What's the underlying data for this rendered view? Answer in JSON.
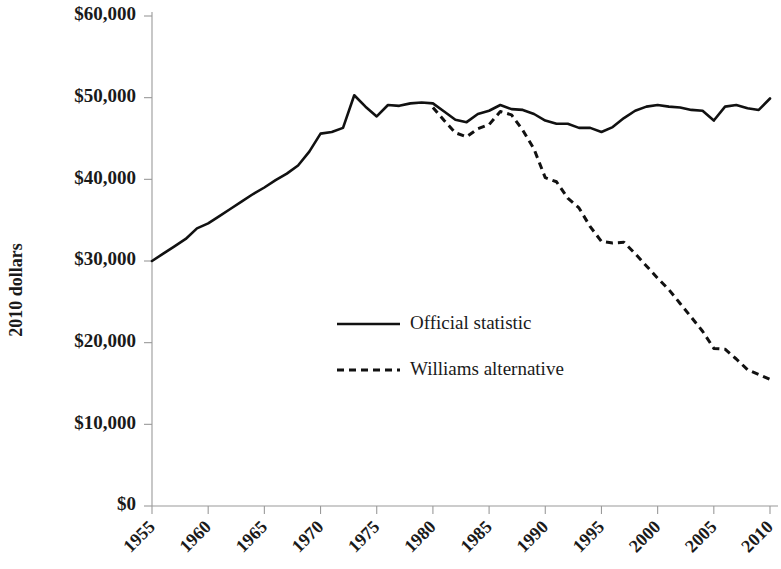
{
  "chart_data": {
    "type": "line",
    "title": "",
    "subtitle": "",
    "xlabel": "",
    "ylabel": "2010 dollars",
    "xlim": [
      1955,
      2010
    ],
    "ylim": [
      0,
      60000
    ],
    "grid": false,
    "legend_position": "center",
    "x_tick_labels": [
      "1955",
      "1960",
      "1965",
      "1970",
      "1975",
      "1980",
      "1985",
      "1990",
      "1995",
      "2000",
      "2005",
      "2010"
    ],
    "x_ticks": [
      1955,
      1960,
      1965,
      1970,
      1975,
      1980,
      1985,
      1990,
      1995,
      2000,
      2005,
      2010
    ],
    "y_tick_labels": [
      "$0",
      "$10,000",
      "$20,000",
      "$30,000",
      "$40,000",
      "$50,000",
      "$60,000"
    ],
    "y_ticks": [
      0,
      10000,
      20000,
      30000,
      40000,
      50000,
      60000
    ],
    "series": [
      {
        "name": "Official statistic",
        "style": "solid",
        "color": "#111111",
        "x": [
          1955,
          1956,
          1957,
          1958,
          1959,
          1960,
          1961,
          1962,
          1963,
          1964,
          1965,
          1966,
          1967,
          1968,
          1969,
          1970,
          1971,
          1972,
          1973,
          1974,
          1975,
          1976,
          1977,
          1978,
          1979,
          1980,
          1981,
          1982,
          1983,
          1984,
          1985,
          1986,
          1987,
          1988,
          1989,
          1990,
          1991,
          1992,
          1993,
          1994,
          1995,
          1996,
          1997,
          1998,
          1999,
          2000,
          2001,
          2002,
          2003,
          2004,
          2005,
          2006,
          2007,
          2008,
          2009,
          2010
        ],
        "y": [
          30000,
          30900,
          31800,
          32700,
          34000,
          34600,
          35500,
          36400,
          37300,
          38200,
          39000,
          39900,
          40700,
          41700,
          43400,
          45600,
          45800,
          46300,
          50300,
          48900,
          47700,
          49100,
          49000,
          49300,
          49400,
          49300,
          48300,
          47300,
          47000,
          48000,
          48400,
          49100,
          48600,
          48500,
          48000,
          47200,
          46800,
          46800,
          46300,
          46300,
          45800,
          46400,
          47500,
          48400,
          48900,
          49100,
          48900,
          48800,
          48500,
          48400,
          47200,
          48900,
          49100,
          48700,
          48500,
          49900
        ]
      },
      {
        "name": "Williams alternative",
        "style": "dashed",
        "color": "#111111",
        "x": [
          1980,
          1981,
          1982,
          1983,
          1984,
          1985,
          1986,
          1987,
          1988,
          1989,
          1990,
          1991,
          1992,
          1993,
          1994,
          1995,
          1996,
          1997,
          1998,
          1999,
          2000,
          2001,
          2002,
          2003,
          2004,
          2005,
          2006,
          2007,
          2008,
          2009,
          2010
        ],
        "y": [
          48800,
          47200,
          45700,
          45200,
          46200,
          46700,
          48300,
          47900,
          46000,
          43700,
          40200,
          39700,
          37700,
          36500,
          34200,
          32400,
          32200,
          32300,
          30900,
          29400,
          27900,
          26500,
          24800,
          23100,
          21400,
          19300,
          19200,
          18000,
          16700,
          16100,
          15500
        ]
      }
    ]
  },
  "legend": {
    "entries": [
      {
        "label": "Official statistic",
        "style": "solid"
      },
      {
        "label": "Williams alternative",
        "style": "dashed"
      }
    ]
  },
  "axes": {
    "y_axis_title": "2010 dollars"
  }
}
